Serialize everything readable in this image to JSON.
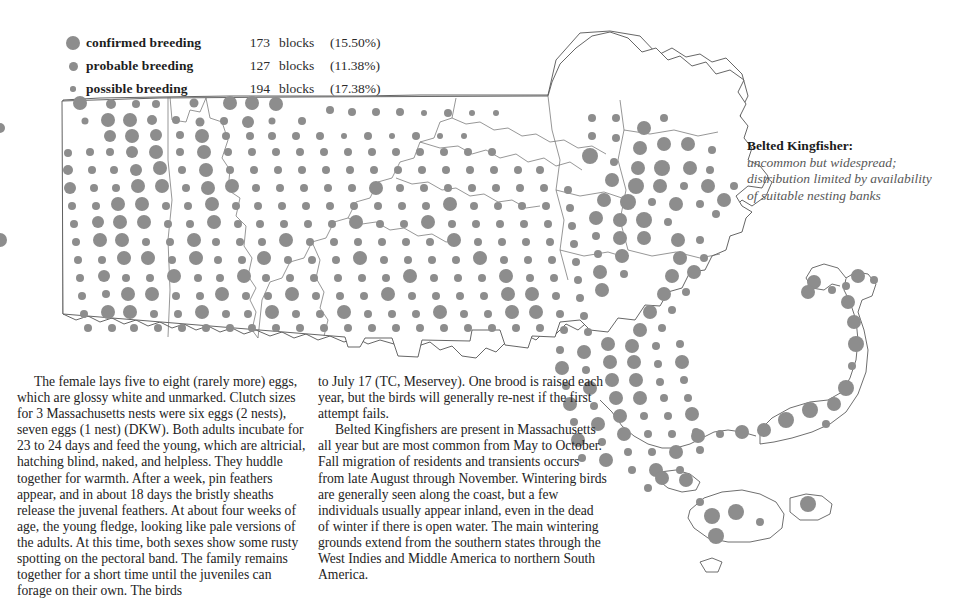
{
  "legend": {
    "rows": [
      {
        "symbol": "large-grey-dot",
        "label": "confirmed breeding",
        "count": "173",
        "unit": "blocks",
        "percent": "(15.50%)"
      },
      {
        "symbol": "medium-grey-dot",
        "label": "probable breeding",
        "count": "127",
        "unit": "blocks",
        "percent": "(11.38%)"
      },
      {
        "symbol": "small-grey-dot",
        "label": "possible breeding",
        "count": "194",
        "unit": "blocks",
        "percent": "(17.38%)"
      }
    ]
  },
  "species_caption": {
    "name": "Belted Kingfisher:",
    "description": "uncommon but widespread; distribution limited by availability of suitable nesting banks"
  },
  "map": {
    "title": "Massachusetts breeding block distribution map",
    "dot_color": "#8d8d8d",
    "outline_color": "#4a4a4a",
    "background_color": "#ffffff"
  },
  "text_columns": {
    "column1": [
      "The female lays five to eight (rarely more) eggs, which are glossy white and unmarked. Clutch sizes for 3 Massachusetts nests were six eggs (2 nests), seven eggs (1 nest) (DKW). Both adults incubate for 23 to 24 days and feed the young, which are altricial, hatching blind, naked, and helpless. They huddle together for warmth. After a week, pin feathers appear, and in about 18 days the bristly sheaths release the juvenal feathers. At about four weeks of age, the young fledge, looking like pale versions of the adults. At this time, both sexes show some rusty spotting on the pectoral band. The family remains together for a short time until the juveniles can forage on their own. The birds"
    ],
    "column2": [
      "to July 17 (TC, Meservey). One brood is raised each year, but the birds will generally re-nest if the first attempt fails.",
      "Belted Kingfishers are present in Massachusetts all year but are most common from May to October. Fall migration of residents and transients occurs from late August through November. Wintering birds are generally seen along the coast, but a few individuals usually appear inland, even in the dead of winter if there is open water. The main wintering grounds extend from the southern states through the West Indies and Middle America to northern South America."
    ]
  }
}
